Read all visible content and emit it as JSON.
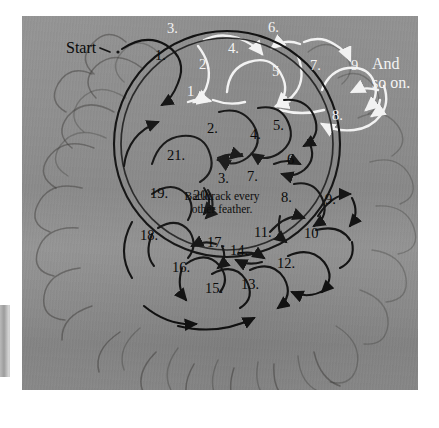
{
  "figure": {
    "kind": "feather-wreath-stitching-order-diagram",
    "medium_note": "photograph of a quilted feather wreath with drawn numbered arrows"
  },
  "colors": {
    "background": "#8b8b8b",
    "page": "#ffffff",
    "black_arrow": "#0d0d0d",
    "white_arrow": "#f2f2f2",
    "ghost_quilting": "#302e2c"
  },
  "labels": {
    "start": "Start",
    "and": "And",
    "so_on": "so on.",
    "backtrack_line1": "Backtrack every",
    "backtrack_line2": "other feather."
  },
  "top_sequence": {
    "description": "straight-run feather spine above the wreath",
    "steps": [
      {
        "n": "1.",
        "color": "black",
        "x": 155,
        "y": 48
      },
      {
        "n": "3.",
        "color": "white",
        "x": 167,
        "y": 21
      },
      {
        "n": "2.",
        "color": "white",
        "x": 199,
        "y": 57
      },
      {
        "n": "4.",
        "color": "white",
        "x": 228,
        "y": 41
      },
      {
        "n": "6.",
        "color": "white",
        "x": 268,
        "y": 20
      },
      {
        "n": "5",
        "color": "white",
        "x": 272,
        "y": 64
      },
      {
        "n": "7.",
        "color": "white",
        "x": 310,
        "y": 58
      },
      {
        "n": "9.",
        "color": "white",
        "x": 351,
        "y": 58
      },
      {
        "n": "8.",
        "color": "white",
        "x": 332,
        "y": 108
      },
      {
        "n": "1",
        "color": "white",
        "x": 187,
        "y": 84
      }
    ]
  },
  "wreath_sequence": {
    "description": "numbered stitching order around the circular feather wreath",
    "steps": [
      {
        "n": "2.",
        "x": 207,
        "y": 121
      },
      {
        "n": "4.",
        "x": 250,
        "y": 127
      },
      {
        "n": "5.",
        "x": 273,
        "y": 118
      },
      {
        "n": "6",
        "x": 287,
        "y": 152
      },
      {
        "n": "3.",
        "x": 218,
        "y": 171
      },
      {
        "n": "7.",
        "x": 247,
        "y": 169
      },
      {
        "n": "8.",
        "x": 281,
        "y": 190
      },
      {
        "n": "9.",
        "x": 325,
        "y": 192
      },
      {
        "n": "10",
        "x": 304,
        "y": 226
      },
      {
        "n": "11.",
        "x": 254,
        "y": 225
      },
      {
        "n": "12.",
        "x": 277,
        "y": 256
      },
      {
        "n": "13.",
        "x": 241,
        "y": 277
      },
      {
        "n": "14.",
        "x": 230,
        "y": 243
      },
      {
        "n": "15.",
        "x": 205,
        "y": 281
      },
      {
        "n": "16.",
        "x": 172,
        "y": 260
      },
      {
        "n": "17.",
        "x": 207,
        "y": 235
      },
      {
        "n": "18.",
        "x": 140,
        "y": 228
      },
      {
        "n": "19.",
        "x": 150,
        "y": 186
      },
      {
        "n": "20.",
        "x": 193,
        "y": 188
      },
      {
        "n": "21.",
        "x": 167,
        "y": 148
      }
    ]
  },
  "annotations": {
    "start_marker": {
      "label": "Start",
      "x": 88,
      "y": 47
    },
    "and_so_on": {
      "x": 372,
      "y": 63
    }
  }
}
